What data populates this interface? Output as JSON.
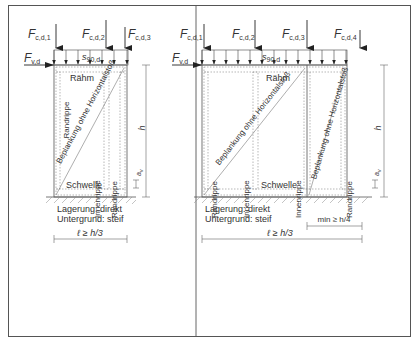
{
  "diagram": {
    "left_panel": {
      "forces": {
        "f1": {
          "symbol": "F",
          "sub": "c,d,1"
        },
        "f2": {
          "symbol": "F",
          "sub": "c,d,2"
        },
        "f3": {
          "symbol": "F",
          "sub": "c,d,3"
        },
        "fv": {
          "symbol": "F",
          "sub": "v,d"
        }
      },
      "distributed_load": {
        "symbol": "s",
        "sub": "90,d"
      },
      "labels": {
        "top_member": "Rähm",
        "bottom_member": "Schwelle",
        "edge_stud_left": "Randrippe",
        "inner_stud": "Innenrippe",
        "edge_stud_right": "Randrippe",
        "sheathing": "Beplankung ohne Horizontalstoß"
      },
      "dimensions": {
        "height": "h",
        "anchor": "a",
        "anchor_sub": "v",
        "length": "ℓ ≥ h/3"
      },
      "support": {
        "bearing": "Lagerung: direkt",
        "subsoil": "Untergrund: steif"
      }
    },
    "right_panel": {
      "forces": {
        "f1": {
          "symbol": "F",
          "sub": "c,d,1"
        },
        "f2": {
          "symbol": "F",
          "sub": "c,d,2"
        },
        "f3": {
          "symbol": "F",
          "sub": "c,d,3"
        },
        "f4": {
          "symbol": "F",
          "sub": "c,d,4"
        },
        "fv": {
          "symbol": "F",
          "sub": "v,d"
        }
      },
      "distributed_load": {
        "symbol": "s",
        "sub": "90,d"
      },
      "labels": {
        "top_member": "Rähm",
        "bottom_member": "Schwelle",
        "edge_stud_left": "Randrippe",
        "inner_stud_1": "Innenrippe",
        "inner_stud_2": "Innenrippe",
        "edge_stud_right": "Randrippe",
        "sheathing_1": "Beplankung ohne Horizontalstoß",
        "sheathing_2": "Beplankung ohne Horizontalstoß"
      },
      "dimensions": {
        "height": "h",
        "anchor": "a",
        "anchor_sub": "v",
        "length": "ℓ ≥ h/3",
        "min_length": "min ≥ h/4"
      },
      "support": {
        "bearing": "Lagerung: direkt",
        "subsoil": "Untergrund: steif"
      }
    }
  }
}
